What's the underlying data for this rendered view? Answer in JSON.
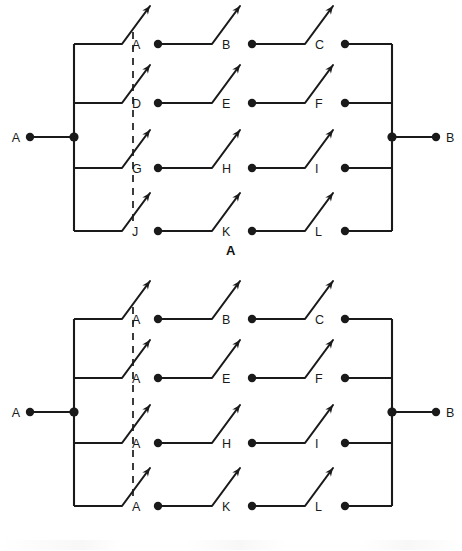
{
  "figure": {
    "panels": [
      {
        "id": "A",
        "caption": "A",
        "left_terminal": "A",
        "right_terminal": "B",
        "columns": 4,
        "rows": 4,
        "ganged_column": 1,
        "switch_labels": [
          [
            "A",
            "B",
            "C"
          ],
          [
            "D",
            "E",
            "F"
          ],
          [
            "G",
            "H",
            "I"
          ],
          [
            "J",
            "K",
            "L"
          ]
        ]
      },
      {
        "id": "B",
        "caption": "B",
        "left_terminal": "A",
        "right_terminal": "B",
        "columns": 4,
        "rows": 4,
        "ganged_column": 1,
        "switch_labels": [
          [
            "A",
            "B",
            "C"
          ],
          [
            "A",
            "E",
            "F"
          ],
          [
            "A",
            "H",
            "I"
          ],
          [
            "A",
            "K",
            "L"
          ]
        ]
      }
    ],
    "colors": {
      "ink": "#1a1a1a",
      "background": "#ffffff"
    }
  }
}
